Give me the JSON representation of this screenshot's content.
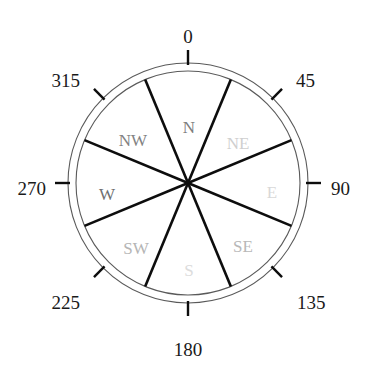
{
  "figure": {
    "name": "compass-rose-diagram",
    "background_color": "#ffffff",
    "width": 365,
    "height": 375
  },
  "chart_data": {
    "type": "pie",
    "title": "",
    "subtitle": "",
    "xlabel": "",
    "ylabel": "",
    "legend_position": "none",
    "grid": false,
    "center": {
      "x": 188,
      "y": 183
    },
    "outer_radius": 120,
    "inner_radius": 112,
    "categories": [
      "N",
      "NE",
      "E",
      "SE",
      "S",
      "SW",
      "W",
      "NW"
    ],
    "values": [
      45,
      45,
      45,
      45,
      45,
      45,
      45,
      45
    ],
    "units": "degrees",
    "axis_range": [
      0,
      360
    ],
    "sector_boundaries_deg": [
      22.5,
      67.5,
      112.5,
      157.5,
      202.5,
      247.5,
      292.5,
      337.5
    ],
    "sectors": [
      {
        "label": "N",
        "center_deg": 0,
        "range_deg": [
          337.5,
          22.5
        ],
        "color": "#7d7d7d",
        "lx": 189,
        "ly": 129
      },
      {
        "label": "NE",
        "center_deg": 45,
        "range_deg": [
          22.5,
          67.5
        ],
        "color": "#cfcfcf",
        "lx": 238,
        "ly": 145
      },
      {
        "label": "E",
        "center_deg": 90,
        "range_deg": [
          67.5,
          112.5
        ],
        "color": "#d8d8d8",
        "lx": 272,
        "ly": 194
      },
      {
        "label": "SE",
        "center_deg": 135,
        "range_deg": [
          112.5,
          157.5
        ],
        "color": "#b8b8b8",
        "lx": 243,
        "ly": 248
      },
      {
        "label": "S",
        "center_deg": 180,
        "range_deg": [
          157.5,
          202.5
        ],
        "color": "#dcdcdc",
        "lx": 189,
        "ly": 272
      },
      {
        "label": "SW",
        "center_deg": 225,
        "range_deg": [
          202.5,
          247.5
        ],
        "color": "#b5b5b5",
        "lx": 136,
        "ly": 250
      },
      {
        "label": "W",
        "center_deg": 270,
        "range_deg": [
          247.5,
          292.5
        ],
        "color": "#6f6f6f",
        "lx": 107,
        "ly": 196
      },
      {
        "label": "NW",
        "center_deg": 315,
        "range_deg": [
          292.5,
          337.5
        ],
        "color": "#828282",
        "lx": 133,
        "ly": 142
      }
    ],
    "tick_labels": [
      {
        "text": "0",
        "deg": 0,
        "lx": 188,
        "ly": 39,
        "anchor": "middle"
      },
      {
        "text": "45",
        "deg": 45,
        "lx": 296,
        "ly": 83,
        "anchor": "start"
      },
      {
        "text": "90",
        "deg": 90,
        "lx": 331,
        "ly": 191,
        "anchor": "start"
      },
      {
        "text": "135",
        "deg": 135,
        "lx": 297,
        "ly": 305,
        "anchor": "start"
      },
      {
        "text": "180",
        "deg": 180,
        "lx": 188,
        "ly": 352,
        "anchor": "middle"
      },
      {
        "text": "225",
        "deg": 225,
        "lx": 80,
        "ly": 305,
        "anchor": "end"
      },
      {
        "text": "270",
        "deg": 270,
        "lx": 46,
        "ly": 191,
        "anchor": "end"
      },
      {
        "text": "315",
        "deg": 315,
        "lx": 80,
        "ly": 83,
        "anchor": "end"
      }
    ],
    "spoke_color": "#0d0d0d",
    "ring_color": "#5a5a5a"
  }
}
